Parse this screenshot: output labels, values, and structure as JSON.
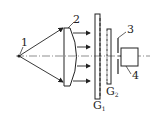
{
  "diagram": {
    "labels": {
      "source": "1",
      "lens": "2",
      "aperture": "3",
      "detector": "4",
      "grating1": "G",
      "grating1_sub": "1",
      "grating2": "G",
      "grating2_sub": "2"
    },
    "colors": {
      "stroke": "#222222",
      "background": "#ffffff"
    }
  }
}
